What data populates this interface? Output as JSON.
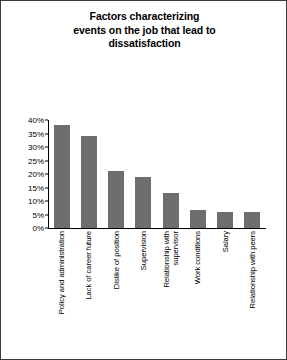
{
  "chart_data": {
    "type": "bar",
    "title": "Factors characterizing events on the job that lead to dissatisfaction",
    "title_lines": [
      "Factors characterizing",
      "events on the job that lead to",
      "dissatisfaction"
    ],
    "xlabel": "",
    "ylabel": "",
    "categories": [
      "Policy and administration",
      "Lack of career future",
      "Dislike of position",
      "Supervision",
      "Relationship with supervisor",
      "Work conditions",
      "Salary",
      "Relationship with peers"
    ],
    "category_lines": [
      [
        "Policy and administration"
      ],
      [
        "Lack of career future"
      ],
      [
        "Dislike of position"
      ],
      [
        "Supervision"
      ],
      [
        "Relationship with",
        "supervisor"
      ],
      [
        "Work conditions"
      ],
      [
        "Salary"
      ],
      [
        "Relationship with peers"
      ]
    ],
    "values": [
      38,
      34,
      21,
      19,
      13,
      6.5,
      6,
      6
    ],
    "ylim": [
      0,
      40
    ],
    "ytick_values": [
      0,
      5,
      10,
      15,
      20,
      25,
      30,
      35,
      40
    ],
    "ytick_labels": [
      "0%",
      "5%",
      "10%",
      "15%",
      "20%",
      "25%",
      "30%",
      "35%",
      "40%"
    ],
    "grid": false,
    "legend": false,
    "bar_color": "#6e6e6e",
    "axis_color": "#000000",
    "background_color": "#ffffff",
    "border_color": "#3a3a3a"
  }
}
